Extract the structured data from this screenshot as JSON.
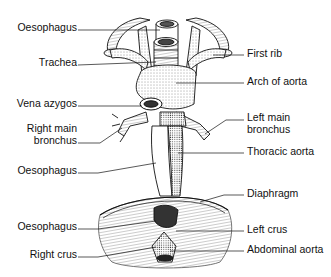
{
  "diagram": {
    "colors": {
      "ink": "#111111",
      "background": "#ffffff"
    },
    "labels_left": [
      {
        "id": "oesophagus-upper",
        "text": "Oesophagus",
        "y": 27
      },
      {
        "id": "trachea",
        "text": "Trachea",
        "y": 62
      },
      {
        "id": "vena-azygos",
        "text": "Vena azygos",
        "y": 103
      },
      {
        "id": "right-main-bronchus",
        "text": "Right main",
        "text2": "bronchus",
        "y": 128
      },
      {
        "id": "oesophagus-middle",
        "text": "Oesophagus",
        "y": 170
      },
      {
        "id": "oesophagus-lower",
        "text": "Oesophagus",
        "y": 226
      },
      {
        "id": "right-crus",
        "text": "Right crus",
        "y": 254
      }
    ],
    "labels_right": [
      {
        "id": "first-rib",
        "text": "First rib",
        "y": 52
      },
      {
        "id": "arch-of-aorta",
        "text": "Arch of aorta",
        "y": 80
      },
      {
        "id": "left-main-bronchus",
        "text": "Left main",
        "text2": "bronchus",
        "y": 117
      },
      {
        "id": "thoracic-aorta",
        "text": "Thoracic aorta",
        "y": 150
      },
      {
        "id": "diaphragm",
        "text": "Diaphragm",
        "y": 192
      },
      {
        "id": "left-crus",
        "text": "Left crus",
        "y": 228
      },
      {
        "id": "abdominal-aorta",
        "text": "Abdominal aorta",
        "y": 248
      }
    ]
  }
}
